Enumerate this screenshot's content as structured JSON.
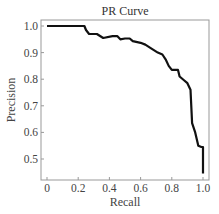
{
  "chart_data": {
    "type": "line",
    "title": "PR Curve",
    "xlabel": "Recall",
    "ylabel": "Precision",
    "xlim": [
      -0.04,
      1.04
    ],
    "ylim": [
      0.42,
      1.02
    ],
    "xticks": [
      0,
      0.2,
      0.4,
      0.6,
      0.8,
      1.0
    ],
    "xtick_labels": [
      "0",
      "0.2",
      "0.4",
      "0.6",
      "0.8",
      "1.0"
    ],
    "yticks": [
      0.5,
      0.6,
      0.7,
      0.8,
      0.9,
      1.0
    ],
    "ytick_labels": [
      "0.5",
      "0.6",
      "0.7",
      "0.8",
      "0.9",
      "1.0"
    ],
    "grid": false,
    "legend": null,
    "series": [
      {
        "name": "PR Curve",
        "color": "#111111",
        "x": [
          0.0,
          0.24,
          0.25,
          0.27,
          0.32,
          0.36,
          0.42,
          0.45,
          0.47,
          0.5,
          0.53,
          0.55,
          0.6,
          0.63,
          0.67,
          0.71,
          0.74,
          0.76,
          0.78,
          0.8,
          0.84,
          0.85,
          0.88,
          0.9,
          0.92,
          0.93,
          0.95,
          0.97,
          0.99,
          1.0,
          1.0
        ],
        "y": [
          1.0,
          1.0,
          0.985,
          0.97,
          0.97,
          0.955,
          0.962,
          0.962,
          0.95,
          0.953,
          0.953,
          0.943,
          0.937,
          0.93,
          0.915,
          0.9,
          0.893,
          0.875,
          0.85,
          0.835,
          0.835,
          0.81,
          0.795,
          0.785,
          0.76,
          0.635,
          0.6,
          0.55,
          0.545,
          0.545,
          0.445
        ]
      }
    ]
  }
}
